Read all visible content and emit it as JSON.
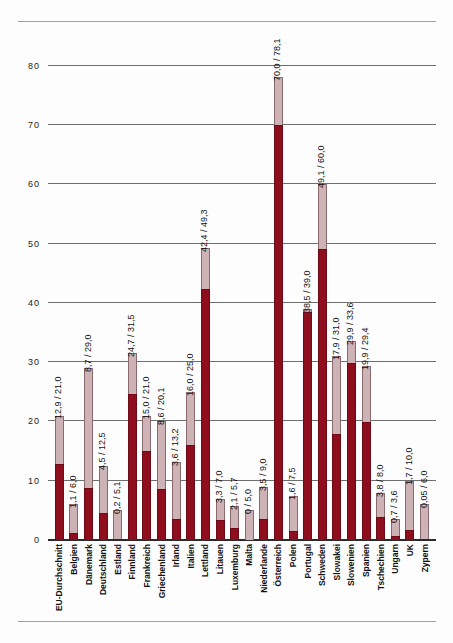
{
  "chart_data": {
    "type": "bar",
    "title": "",
    "subtitle": "",
    "xlabel": "",
    "ylabel": "",
    "ylim": [
      0,
      85
    ],
    "yticks": [
      0,
      10,
      20,
      30,
      40,
      50,
      60,
      70,
      80
    ],
    "ytick_labels": [
      "0",
      "10",
      "20",
      "30",
      "40",
      "50",
      "60",
      "70",
      "80"
    ],
    "grid": true,
    "legend_position": "none",
    "stacked": true,
    "decimal_separator": ",",
    "categories": [
      "EU-Durchschnitt",
      "Belgien",
      "Dänemark",
      "Deutschland",
      "Estland",
      "Finnland",
      "Frankreich",
      "Griechenland",
      "Irland",
      "Italien",
      "Lettland",
      "Litauen",
      "Luxemburg",
      "Malta",
      "Niederlande",
      "Österreich",
      "Polen",
      "Portugal",
      "Schweden",
      "Slowakei",
      "Slowenien",
      "Spanien",
      "Tschechien",
      "Ungarn",
      "UK",
      "Zypern"
    ],
    "series": [
      {
        "name": "Wert 1",
        "color": "#8e0e1e",
        "values": [
          12.9,
          1.1,
          8.7,
          4.5,
          0.2,
          24.7,
          15.0,
          8.6,
          3.6,
          16.0,
          42.4,
          3.3,
          2.1,
          0,
          3.5,
          70.0,
          1.6,
          38.5,
          49.1,
          17.9,
          29.9,
          19.9,
          3.8,
          0.7,
          1.7,
          0.05
        ]
      },
      {
        "name": "Wert 2",
        "color": "#cdb3b6",
        "values": [
          21.0,
          6.0,
          29.0,
          12.5,
          5.1,
          31.5,
          21.0,
          20.1,
          13.2,
          25.0,
          49.3,
          7.0,
          5.7,
          5.0,
          9.0,
          78.1,
          7.5,
          39.0,
          60.0,
          31.0,
          33.6,
          29.4,
          8.0,
          3.6,
          10.0,
          6.0
        ]
      }
    ],
    "point_labels": [
      "12,9 / 21,0",
      "1,1 / 6,0",
      "8,7 / 29,0",
      "4,5 / 12,5",
      "0,2 / 5,1",
      "24,7 / 31,5",
      "15,0 / 21,0",
      "8,6 / 20,1",
      "3,6 / 13,2",
      "16,0 / 25,0",
      "42,4 / 49,3",
      "3,3 / 7,0",
      "2,1 / 5,7",
      "0 / 5,0",
      "3,5 / 9,0",
      "70,0 / 78,1",
      "1,6 / 7,5",
      "38,5 / 39,0",
      "49,1 / 60,0",
      "17,9 / 31,0",
      "29,9 / 33,6",
      "19,9 / 29,4",
      "3,8 / 8,0",
      "0,7 / 3,6",
      "1,7 / 10,0",
      "0,05 / 6,0"
    ]
  },
  "colors": {
    "bar_dark": "#8e0e1e",
    "bar_light": "#cdb3b6",
    "gridline": "#6f6f6f",
    "axis": "#2a2a2a",
    "rule": "#b49a9c",
    "background": "#fefdfd",
    "text": "#111111"
  }
}
